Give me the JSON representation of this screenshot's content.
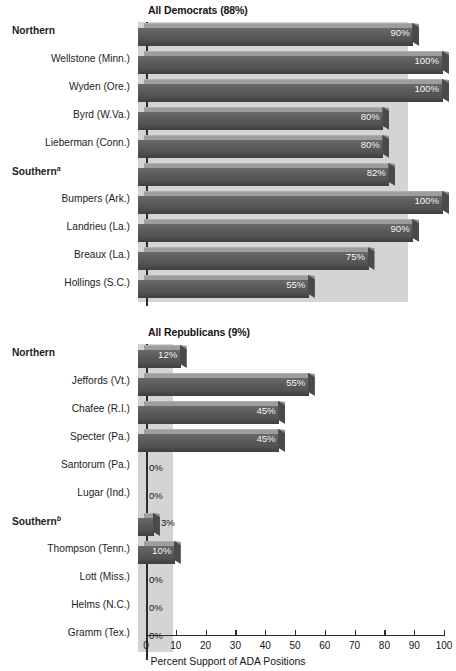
{
  "axis": {
    "title": "Percent Support of ADA Positions",
    "ticks": [
      "0",
      "10",
      "20",
      "30",
      "40",
      "50",
      "60",
      "70",
      "80",
      "90",
      "100"
    ],
    "min": 0,
    "max": 100
  },
  "colors": {
    "bar_top": "#9d9d9d",
    "bar_face": "#5d5d5d",
    "bar_bottom": "#474747",
    "band": "#d2d2d2",
    "axis": "#2b2b2b",
    "text": "#141414",
    "value_text": "#ffffff"
  },
  "panels": [
    {
      "title": "All Democrats (88%)",
      "average": 88,
      "rows": [
        {
          "label": "Northern",
          "group": true,
          "sup": "",
          "value": 90,
          "value_label": "90%"
        },
        {
          "label": "Wellstone (Minn.)",
          "group": false,
          "sup": "",
          "value": 100,
          "value_label": "100%"
        },
        {
          "label": "Wyden (Ore.)",
          "group": false,
          "sup": "",
          "value": 100,
          "value_label": "100%"
        },
        {
          "label": "Byrd (W.Va.)",
          "group": false,
          "sup": "",
          "value": 80,
          "value_label": "80%"
        },
        {
          "label": "Lieberman (Conn.)",
          "group": false,
          "sup": "",
          "value": 80,
          "value_label": "80%"
        },
        {
          "label": "Southern",
          "group": true,
          "sup": "a",
          "value": 82,
          "value_label": "82%"
        },
        {
          "label": "Bumpers (Ark.)",
          "group": false,
          "sup": "",
          "value": 100,
          "value_label": "100%"
        },
        {
          "label": "Landrieu (La.)",
          "group": false,
          "sup": "",
          "value": 90,
          "value_label": "90%"
        },
        {
          "label": "Breaux (La.)",
          "group": false,
          "sup": "",
          "value": 75,
          "value_label": "75%"
        },
        {
          "label": "Hollings (S.C.)",
          "group": false,
          "sup": "",
          "value": 55,
          "value_label": "55%"
        }
      ]
    },
    {
      "title": "All Republicans (9%)",
      "average": 9,
      "rows": [
        {
          "label": "Northern",
          "group": true,
          "sup": "",
          "value": 12,
          "value_label": "12%"
        },
        {
          "label": "Jeffords (Vt.)",
          "group": false,
          "sup": "",
          "value": 55,
          "value_label": "55%"
        },
        {
          "label": "Chafee (R.I.)",
          "group": false,
          "sup": "",
          "value": 45,
          "value_label": "45%"
        },
        {
          "label": "Specter (Pa.)",
          "group": false,
          "sup": "",
          "value": 45,
          "value_label": "45%"
        },
        {
          "label": "Santorum (Pa.)",
          "group": false,
          "sup": "",
          "value": 0,
          "value_label": "0%"
        },
        {
          "label": "Lugar (Ind.)",
          "group": false,
          "sup": "",
          "value": 0,
          "value_label": "0%"
        },
        {
          "label": "Southern",
          "group": true,
          "sup": "b",
          "value": 3,
          "value_label": "3%"
        },
        {
          "label": "Thompson (Tenn.)",
          "group": false,
          "sup": "",
          "value": 10,
          "value_label": "10%"
        },
        {
          "label": "Lott (Miss.)",
          "group": false,
          "sup": "",
          "value": 0,
          "value_label": "0%"
        },
        {
          "label": "Helms (N.C.)",
          "group": false,
          "sup": "",
          "value": 0,
          "value_label": "0%"
        },
        {
          "label": "Gramm (Tex.)",
          "group": false,
          "sup": "",
          "value": 0,
          "value_label": "0%"
        }
      ]
    }
  ],
  "chart_data": {
    "type": "bar",
    "title": "",
    "orientation": "horizontal",
    "xlabel": "Percent Support of ADA Positions",
    "ylabel": "",
    "xlim": [
      0,
      100
    ],
    "grid": false,
    "legend": "none",
    "panels": [
      {
        "title": "All Democrats (88%)",
        "average_reference": 88,
        "categories": [
          "Northern",
          "Wellstone (Minn.)",
          "Wyden (Ore.)",
          "Byrd (W.Va.)",
          "Lieberman (Conn.)",
          "Southern",
          "Bumpers (Ark.)",
          "Landrieu (La.)",
          "Breaux (La.)",
          "Hollings (S.C.)"
        ],
        "values": [
          90,
          100,
          100,
          80,
          80,
          82,
          100,
          90,
          75,
          55
        ],
        "data_labels": [
          "90%",
          "100%",
          "100%",
          "80%",
          "80%",
          "82%",
          "100%",
          "90%",
          "75%",
          "55%"
        ],
        "group_rows": [
          "Northern",
          "Southern"
        ],
        "annotations": [
          "Southern carries footnote marker a"
        ]
      },
      {
        "title": "All Republicans (9%)",
        "average_reference": 9,
        "categories": [
          "Northern",
          "Jeffords (Vt.)",
          "Chafee (R.I.)",
          "Specter (Pa.)",
          "Santorum (Pa.)",
          "Lugar (Ind.)",
          "Southern",
          "Thompson (Tenn.)",
          "Lott (Miss.)",
          "Helms (N.C.)",
          "Gramm (Tex.)"
        ],
        "values": [
          12,
          55,
          45,
          45,
          0,
          0,
          3,
          10,
          0,
          0,
          0
        ],
        "data_labels": [
          "12%",
          "55%",
          "45%",
          "45%",
          "0%",
          "0%",
          "3%",
          "10%",
          "0%",
          "0%",
          "0%"
        ],
        "group_rows": [
          "Northern",
          "Southern"
        ],
        "annotations": [
          "Southern carries footnote marker b"
        ]
      }
    ]
  }
}
